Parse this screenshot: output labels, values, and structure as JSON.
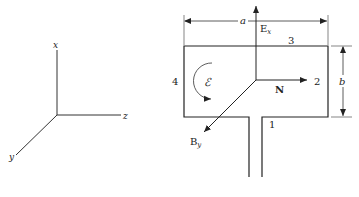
{
  "axes": {
    "x_label": "x",
    "y_label": "y",
    "z_label": "z"
  },
  "loop": {
    "width_label": "a",
    "height_label": "b",
    "side_labels": {
      "side1": "1",
      "side2": "2",
      "side3": "3",
      "side4": "4"
    },
    "emf_label": "ℰ",
    "normal_label": "N",
    "electric_field_label": "E",
    "electric_field_sub": "x",
    "magnetic_field_label": "B",
    "magnetic_field_sub": "y"
  }
}
